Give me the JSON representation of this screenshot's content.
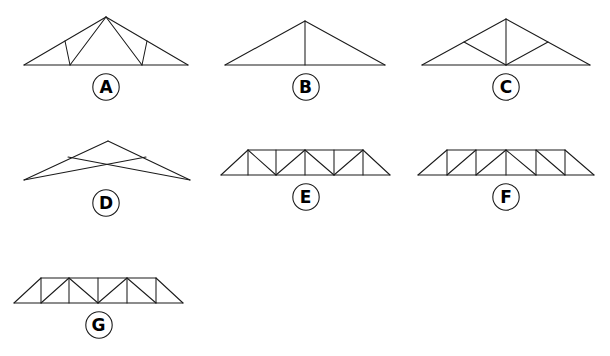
{
  "figure": {
    "background_color": "#ffffff",
    "line_color": "#1b1b1b",
    "label_color": "#000000"
  },
  "trusses": [
    {
      "id": "truss-a",
      "label": "A",
      "name": "fink-truss",
      "description": "Fink truss: gabled outline with W-shaped web members",
      "viewbox": "0 0 200 64",
      "left": 6,
      "top": 8,
      "width": 200,
      "lines": [
        {
          "name": "bottom-chord",
          "x1": 18,
          "y1": 57,
          "x2": 182,
          "y2": 57
        },
        {
          "name": "left-rafter",
          "x1": 18,
          "y1": 57,
          "x2": 100,
          "y2": 9
        },
        {
          "name": "right-rafter",
          "x1": 182,
          "y1": 57,
          "x2": 100,
          "y2": 9
        },
        {
          "name": "left-outer-web",
          "x1": 59,
          "y1": 33,
          "x2": 64,
          "y2": 57
        },
        {
          "name": "left-inner-web",
          "x1": 64,
          "y1": 57,
          "x2": 100,
          "y2": 9
        },
        {
          "name": "right-inner-web",
          "x1": 136,
          "y1": 57,
          "x2": 100,
          "y2": 9
        },
        {
          "name": "right-outer-web",
          "x1": 141,
          "y1": 33,
          "x2": 136,
          "y2": 57
        }
      ]
    },
    {
      "id": "truss-b",
      "label": "B",
      "name": "king-post-truss",
      "description": "King post truss: single triangle with one vertical centre post",
      "viewbox": "0 0 185 64",
      "left": 213,
      "top": 8,
      "width": 185,
      "lines": [
        {
          "name": "bottom-chord",
          "x1": 12,
          "y1": 57,
          "x2": 172,
          "y2": 57
        },
        {
          "name": "left-rafter",
          "x1": 12,
          "y1": 57,
          "x2": 92,
          "y2": 13
        },
        {
          "name": "right-rafter",
          "x1": 172,
          "y1": 57,
          "x2": 92,
          "y2": 13
        },
        {
          "name": "king-post",
          "x1": 92,
          "y1": 13,
          "x2": 92,
          "y2": 57
        }
      ]
    },
    {
      "id": "truss-c",
      "label": "C",
      "name": "fan-truss",
      "description": "Fan truss: centre post with two diagonals to rafter mid-points",
      "viewbox": "0 0 200 64",
      "left": 406,
      "top": 8,
      "width": 200,
      "lines": [
        {
          "name": "bottom-chord",
          "x1": 16,
          "y1": 57,
          "x2": 184,
          "y2": 57
        },
        {
          "name": "left-rafter",
          "x1": 16,
          "y1": 57,
          "x2": 100,
          "y2": 11
        },
        {
          "name": "right-rafter",
          "x1": 184,
          "y1": 57,
          "x2": 100,
          "y2": 11
        },
        {
          "name": "centre-post",
          "x1": 100,
          "y1": 11,
          "x2": 100,
          "y2": 57
        },
        {
          "name": "left-diagonal",
          "x1": 100,
          "y1": 57,
          "x2": 58,
          "y2": 34
        },
        {
          "name": "right-diagonal",
          "x1": 100,
          "y1": 57,
          "x2": 142,
          "y2": 34
        }
      ]
    },
    {
      "id": "truss-d",
      "label": "D",
      "name": "scissor-truss",
      "description": "Scissor truss: no bottom chord, two crossing inclined ties",
      "viewbox": "0 0 200 64",
      "left": 6,
      "top": 124,
      "width": 200,
      "lines": [
        {
          "name": "left-rafter",
          "x1": 18,
          "y1": 56,
          "x2": 102,
          "y2": 17
        },
        {
          "name": "right-rafter",
          "x1": 184,
          "y1": 56,
          "x2": 102,
          "y2": 17
        },
        {
          "name": "left-to-right-tie",
          "x1": 18,
          "y1": 56,
          "x2": 140,
          "y2": 33
        },
        {
          "name": "right-to-left-tie",
          "x1": 184,
          "y1": 56,
          "x2": 62,
          "y2": 33
        }
      ]
    },
    {
      "id": "truss-e",
      "label": "E",
      "name": "warren-truss-with-verticals",
      "description": "Flat parallel-chord truss, zig-zag diagonals with verticals",
      "viewbox": "0 0 185 52",
      "left": 213,
      "top": 130,
      "width": 185,
      "lines": [
        {
          "name": "bottom-chord",
          "x1": 8,
          "y1": 45,
          "x2": 177,
          "y2": 45
        },
        {
          "name": "top-chord",
          "x1": 35,
          "y1": 20,
          "x2": 150,
          "y2": 20
        },
        {
          "name": "left-end-diagonal",
          "x1": 8,
          "y1": 45,
          "x2": 35,
          "y2": 20
        },
        {
          "name": "right-end-diagonal",
          "x1": 177,
          "y1": 45,
          "x2": 150,
          "y2": 20
        },
        {
          "name": "vertical-1",
          "x1": 35,
          "y1": 20,
          "x2": 35,
          "y2": 45
        },
        {
          "name": "diagonal-1",
          "x1": 35,
          "y1": 20,
          "x2": 63,
          "y2": 45
        },
        {
          "name": "vertical-2",
          "x1": 63,
          "y1": 20,
          "x2": 63,
          "y2": 45
        },
        {
          "name": "diagonal-2",
          "x1": 63,
          "y1": 45,
          "x2": 92,
          "y2": 20
        },
        {
          "name": "vertical-3",
          "x1": 92,
          "y1": 20,
          "x2": 92,
          "y2": 45
        },
        {
          "name": "diagonal-3",
          "x1": 92,
          "y1": 20,
          "x2": 121,
          "y2": 45
        },
        {
          "name": "vertical-4",
          "x1": 121,
          "y1": 20,
          "x2": 121,
          "y2": 45
        },
        {
          "name": "diagonal-4",
          "x1": 121,
          "y1": 45,
          "x2": 150,
          "y2": 20
        },
        {
          "name": "vertical-5",
          "x1": 150,
          "y1": 20,
          "x2": 150,
          "y2": 45
        }
      ]
    },
    {
      "id": "truss-f",
      "label": "F",
      "name": "howe-truss",
      "description": "Flat parallel-chord truss, parallel diagonals mirrored at centre",
      "viewbox": "0 0 200 52",
      "left": 406,
      "top": 130,
      "width": 200,
      "lines": [
        {
          "name": "bottom-chord",
          "x1": 12,
          "y1": 45,
          "x2": 188,
          "y2": 45
        },
        {
          "name": "top-chord",
          "x1": 41,
          "y1": 20,
          "x2": 159,
          "y2": 20
        },
        {
          "name": "left-end-diagonal",
          "x1": 12,
          "y1": 45,
          "x2": 41,
          "y2": 20
        },
        {
          "name": "right-end-diagonal",
          "x1": 188,
          "y1": 45,
          "x2": 159,
          "y2": 20
        },
        {
          "name": "vertical-1",
          "x1": 41,
          "y1": 20,
          "x2": 41,
          "y2": 45
        },
        {
          "name": "diagonal-1",
          "x1": 41,
          "y1": 45,
          "x2": 70,
          "y2": 20
        },
        {
          "name": "vertical-2",
          "x1": 70,
          "y1": 20,
          "x2": 70,
          "y2": 45
        },
        {
          "name": "diagonal-2",
          "x1": 70,
          "y1": 45,
          "x2": 100,
          "y2": 20
        },
        {
          "name": "centre-vertical",
          "x1": 100,
          "y1": 20,
          "x2": 100,
          "y2": 45
        },
        {
          "name": "diagonal-3",
          "x1": 100,
          "y1": 20,
          "x2": 130,
          "y2": 45
        },
        {
          "name": "vertical-3",
          "x1": 130,
          "y1": 20,
          "x2": 130,
          "y2": 45
        },
        {
          "name": "diagonal-4",
          "x1": 130,
          "y1": 20,
          "x2": 159,
          "y2": 45
        },
        {
          "name": "vertical-4",
          "x1": 159,
          "y1": 20,
          "x2": 159,
          "y2": 45
        }
      ]
    },
    {
      "id": "truss-g",
      "label": "G",
      "name": "pratt-truss",
      "description": "Flat parallel-chord truss, diagonals and verticals mirrored at centre",
      "viewbox": "0 0 185 52",
      "left": 6,
      "top": 258,
      "width": 185,
      "lines": [
        {
          "name": "bottom-chord",
          "x1": 8,
          "y1": 45,
          "x2": 177,
          "y2": 45
        },
        {
          "name": "top-chord",
          "x1": 35,
          "y1": 20,
          "x2": 150,
          "y2": 20
        },
        {
          "name": "left-end-diagonal",
          "x1": 8,
          "y1": 45,
          "x2": 35,
          "y2": 20
        },
        {
          "name": "right-end-diagonal",
          "x1": 177,
          "y1": 45,
          "x2": 150,
          "y2": 20
        },
        {
          "name": "vertical-1",
          "x1": 35,
          "y1": 20,
          "x2": 35,
          "y2": 45
        },
        {
          "name": "diagonal-1",
          "x1": 35,
          "y1": 45,
          "x2": 63,
          "y2": 20
        },
        {
          "name": "vertical-2",
          "x1": 63,
          "y1": 20,
          "x2": 63,
          "y2": 45
        },
        {
          "name": "diagonal-2",
          "x1": 63,
          "y1": 20,
          "x2": 92,
          "y2": 45
        },
        {
          "name": "centre-vertical",
          "x1": 92,
          "y1": 20,
          "x2": 92,
          "y2": 45
        },
        {
          "name": "diagonal-3",
          "x1": 92,
          "y1": 45,
          "x2": 121,
          "y2": 20
        },
        {
          "name": "vertical-3",
          "x1": 121,
          "y1": 20,
          "x2": 121,
          "y2": 45
        },
        {
          "name": "diagonal-4",
          "x1": 121,
          "y1": 20,
          "x2": 150,
          "y2": 45
        },
        {
          "name": "vertical-4",
          "x1": 150,
          "y1": 20,
          "x2": 150,
          "y2": 45
        }
      ]
    }
  ]
}
